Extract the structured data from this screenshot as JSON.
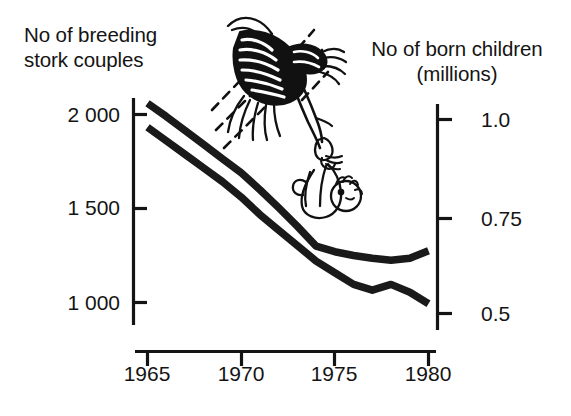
{
  "figure": {
    "background_color": "#ffffff",
    "ink_color": "#141414",
    "illustration_name": "stork-carrying-baby-bundle"
  },
  "left_axis": {
    "title_line1": "No of breeding",
    "title_line2": "stork couples",
    "ticks": [
      "2 000",
      "1 500",
      "1 000"
    ],
    "tick_values": [
      2000,
      1500,
      1000
    ],
    "range": [
      850,
      2100
    ]
  },
  "right_axis": {
    "title_line1": "No of born children",
    "title_line2": "(millions)",
    "ticks": [
      "1.0",
      "0.75",
      "0.5"
    ],
    "tick_values": [
      1.0,
      0.75,
      0.5
    ],
    "range": [
      0.45,
      1.05
    ]
  },
  "x_axis": {
    "ticks": [
      "1965",
      "1970",
      "1975",
      "1980"
    ],
    "tick_values": [
      1965,
      1970,
      1975,
      1980
    ],
    "range": [
      1964.5,
      1980.5
    ]
  },
  "chart_data": {
    "type": "line",
    "title": "",
    "subtitle": "",
    "xlabel": "",
    "ylabel": "No of breeding stork couples",
    "y2label": "No of born children (millions)",
    "grid": false,
    "legend": "none",
    "annotations": [
      "stork carrying a baby in a bundle"
    ],
    "xlim": [
      1964.5,
      1980.5
    ],
    "ylim": [
      850,
      2100
    ],
    "y2lim": [
      0.45,
      1.05
    ],
    "x": [
      1965,
      1966,
      1967,
      1968,
      1969,
      1970,
      1971,
      1972,
      1973,
      1974,
      1975,
      1976,
      1977,
      1978,
      1979,
      1980
    ],
    "series": [
      {
        "name": "No of breeding stork couples",
        "axis": "left",
        "units": "couples",
        "values": [
          2060,
          1990,
          1915,
          1840,
          1765,
          1690,
          1600,
          1505,
          1405,
          1300,
          1270,
          1250,
          1235,
          1225,
          1235,
          1275
        ]
      },
      {
        "name": "No of born children",
        "axis": "right",
        "units": "millions",
        "values": [
          0.98,
          0.945,
          0.91,
          0.875,
          0.84,
          0.8,
          0.755,
          0.715,
          0.675,
          0.635,
          0.605,
          0.575,
          0.56,
          0.575,
          0.555,
          0.525
        ]
      }
    ]
  }
}
